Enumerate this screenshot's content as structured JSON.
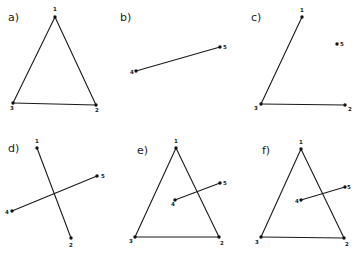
{
  "figure": {
    "panels": [
      {
        "id": "a",
        "label": "a)",
        "label_pos": [
          8,
          21
        ],
        "points": [
          {
            "name": "1",
            "x": 55,
            "y": 17,
            "lx": 53,
            "ly": 11
          },
          {
            "name": "2",
            "x": 96,
            "y": 105,
            "lx": 95,
            "ly": 112
          },
          {
            "name": "3",
            "x": 13,
            "y": 103,
            "lx": 10,
            "ly": 110
          }
        ],
        "segments": [
          [
            "1",
            "2"
          ],
          [
            "2",
            "3"
          ],
          [
            "3",
            "1"
          ]
        ]
      },
      {
        "id": "b",
        "label": "b)",
        "label_pos": [
          120,
          21
        ],
        "points": [
          {
            "name": "4",
            "x": 136,
            "y": 71,
            "lx": 130,
            "ly": 74
          },
          {
            "name": "5",
            "x": 220,
            "y": 47,
            "lx": 223,
            "ly": 49
          }
        ],
        "segments": [
          [
            "4",
            "5"
          ]
        ]
      },
      {
        "id": "c",
        "label": "c)",
        "label_pos": [
          251,
          21
        ],
        "points": [
          {
            "name": "1",
            "x": 302,
            "y": 17,
            "lx": 300,
            "ly": 12
          },
          {
            "name": "2",
            "x": 345,
            "y": 105,
            "lx": 348,
            "ly": 111
          },
          {
            "name": "3",
            "x": 261,
            "y": 104,
            "lx": 254,
            "ly": 110
          },
          {
            "name": "5",
            "x": 337,
            "y": 44,
            "lx": 340,
            "ly": 46
          }
        ],
        "segments": [
          [
            "1",
            "3"
          ],
          [
            "3",
            "2"
          ]
        ]
      },
      {
        "id": "d",
        "label": "d)",
        "label_pos": [
          8,
          152
        ],
        "points": [
          {
            "name": "1",
            "x": 37,
            "y": 148,
            "lx": 35,
            "ly": 143
          },
          {
            "name": "2",
            "x": 71,
            "y": 238,
            "lx": 69,
            "ly": 247
          },
          {
            "name": "4",
            "x": 12,
            "y": 211,
            "lx": 5,
            "ly": 214
          },
          {
            "name": "5",
            "x": 97,
            "y": 176,
            "lx": 101,
            "ly": 178
          }
        ],
        "segments": [
          [
            "1",
            "2"
          ],
          [
            "4",
            "5"
          ]
        ]
      },
      {
        "id": "e",
        "label": "e)",
        "label_pos": [
          137,
          154
        ],
        "points": [
          {
            "name": "1",
            "x": 176,
            "y": 148,
            "lx": 174,
            "ly": 143
          },
          {
            "name": "2",
            "x": 219,
            "y": 237,
            "lx": 220,
            "ly": 245
          },
          {
            "name": "3",
            "x": 135,
            "y": 237,
            "lx": 129,
            "ly": 243
          },
          {
            "name": "4",
            "x": 175,
            "y": 200,
            "lx": 171,
            "ly": 206
          },
          {
            "name": "5",
            "x": 220,
            "y": 183,
            "lx": 223,
            "ly": 185
          }
        ],
        "segments": [
          [
            "1",
            "2"
          ],
          [
            "2",
            "3"
          ],
          [
            "3",
            "1"
          ],
          [
            "4",
            "5"
          ]
        ]
      },
      {
        "id": "f",
        "label": "f)",
        "label_pos": [
          262,
          154
        ],
        "points": [
          {
            "name": "1",
            "x": 301,
            "y": 149,
            "lx": 299,
            "ly": 144
          },
          {
            "name": "2",
            "x": 344,
            "y": 238,
            "lx": 345,
            "ly": 246
          },
          {
            "name": "3",
            "x": 261,
            "y": 237,
            "lx": 255,
            "ly": 244
          },
          {
            "name": "4",
            "x": 301,
            "y": 200,
            "lx": 295,
            "ly": 203
          },
          {
            "name": "5",
            "x": 345,
            "y": 187,
            "lx": 347,
            "ly": 189
          }
        ],
        "segments": [
          [
            "1",
            "2"
          ],
          [
            "2",
            "3"
          ],
          [
            "3",
            "1"
          ],
          [
            "4",
            "5"
          ]
        ]
      }
    ]
  }
}
